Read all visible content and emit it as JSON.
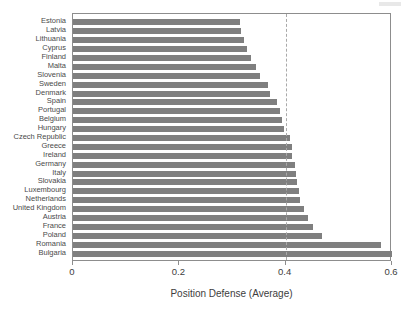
{
  "chart_data": {
    "type": "bar",
    "orientation": "horizontal",
    "title": "",
    "subtitle": "",
    "xlabel": "Position Defense (Average)",
    "ylabel": "",
    "xlim": [
      0,
      0.6
    ],
    "ylim": null,
    "xticks": [
      0,
      0.2,
      0.4,
      0.6
    ],
    "xtick_labels": [
      "0",
      "0.2",
      "0.4",
      "0.6"
    ],
    "grid": false,
    "legend": null,
    "legend_position": "none",
    "bar_color": "#7f7f7f",
    "annotations": [
      {
        "type": "vertical-reference-line",
        "value": 0.4,
        "style": "dashed",
        "color": "#a9a9a9",
        "label": ""
      }
    ],
    "categories": [
      "Estonia",
      "Latvia",
      "Lithuania",
      "Cyprus",
      "Finland",
      "Malta",
      "Slovenia",
      "Sweden",
      "Denmark",
      "Spain",
      "Portugal",
      "Belgium",
      "Hungary",
      "Czech Republic",
      "Greece",
      "Ireland",
      "Germany",
      "Italy",
      "Slovakia",
      "Luxembourg",
      "Netherlands",
      "United Kingdom",
      "Austria",
      "France",
      "Poland",
      "Romania",
      "Bulgaria"
    ],
    "values": [
      0.315,
      0.316,
      0.322,
      0.328,
      0.334,
      0.344,
      0.352,
      0.367,
      0.371,
      0.383,
      0.39,
      0.394,
      0.396,
      0.408,
      0.411,
      0.412,
      0.417,
      0.42,
      0.421,
      0.425,
      0.427,
      0.435,
      0.442,
      0.451,
      0.469,
      0.579,
      0.6
    ]
  }
}
